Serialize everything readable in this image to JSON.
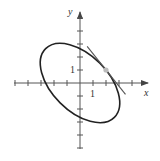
{
  "figure": {
    "type": "ellipse-with-tangent-line",
    "equation": "x^2 + xy + y^2 = 7",
    "axes": {
      "x_label": "x",
      "y_label": "y",
      "x_tick_label": "1",
      "y_tick_label": "1",
      "x_ticks": [
        -5,
        -4,
        -3,
        -2,
        -1,
        1,
        2,
        3,
        4
      ],
      "y_ticks": [
        -5,
        -4,
        -3,
        -2,
        -1,
        1,
        2,
        3,
        4,
        5
      ]
    },
    "tangent_point": {
      "x": 2,
      "y": 1
    },
    "tangent_slope": -1.25,
    "colors": {
      "curve": "#222222",
      "axes": "#555555",
      "tangent_line": "#555555",
      "point": "#bbbbbb"
    }
  }
}
